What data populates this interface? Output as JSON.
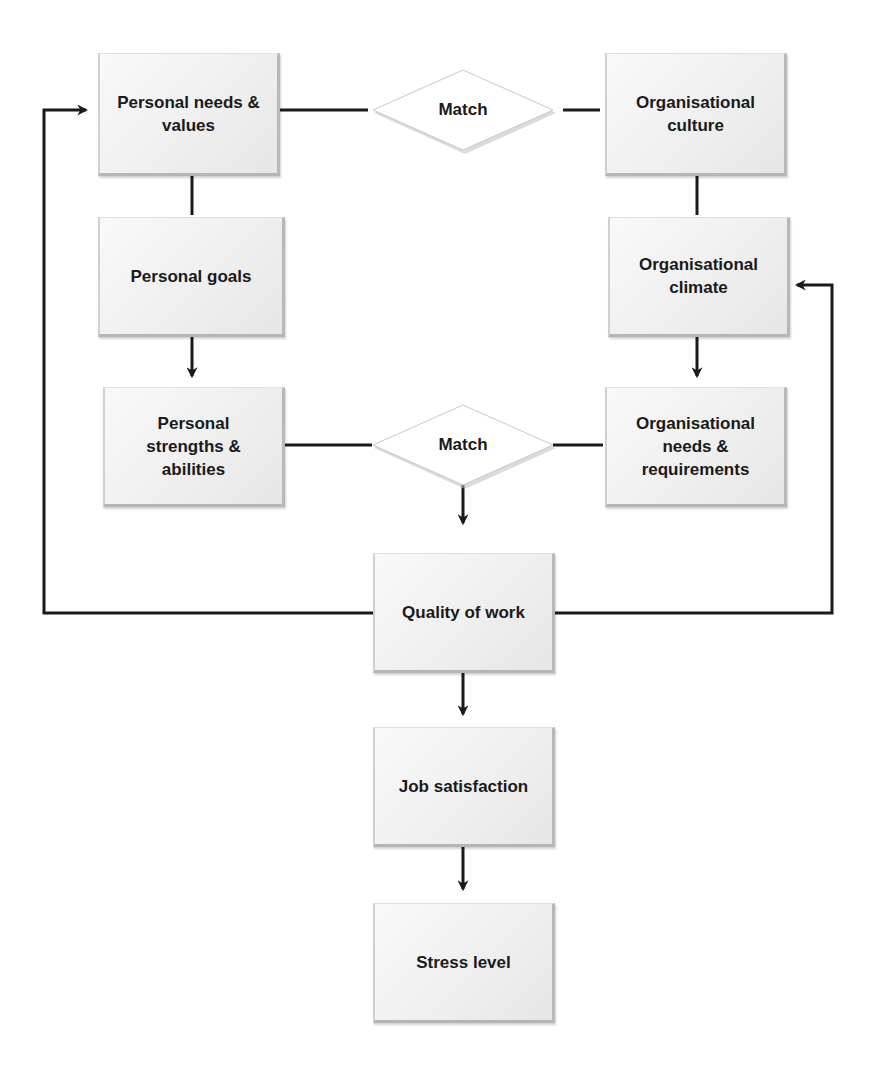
{
  "diagram": {
    "type": "flowchart",
    "nodes": {
      "personal_needs": {
        "label": "Personal needs & values",
        "lines": [
          "Personal needs",
          "& values"
        ]
      },
      "personal_goals": {
        "label": "Personal goals"
      },
      "personal_strengths": {
        "label": "Personal strengths & abilities"
      },
      "match_top": {
        "label": "Match"
      },
      "match_bottom": {
        "label": "Match"
      },
      "org_culture": {
        "label": "Organisational culture"
      },
      "org_climate": {
        "label": "Organisational climate"
      },
      "org_needs": {
        "label": "Organisational needs & requirements"
      },
      "quality_of_work": {
        "label": "Quality of work"
      },
      "job_satisfaction": {
        "label": "Job satisfaction"
      },
      "stress_level": {
        "label": "Stress level"
      }
    },
    "edges": [
      {
        "from": "personal_needs",
        "to": "match_top",
        "arrow": false
      },
      {
        "from": "match_top",
        "to": "org_culture",
        "arrow": false
      },
      {
        "from": "personal_needs",
        "to": "personal_goals",
        "arrow": false
      },
      {
        "from": "personal_goals",
        "to": "personal_strengths",
        "arrow": true
      },
      {
        "from": "org_culture",
        "to": "org_climate",
        "arrow": false
      },
      {
        "from": "org_climate",
        "to": "org_needs",
        "arrow": true
      },
      {
        "from": "personal_strengths",
        "to": "match_bottom",
        "arrow": false
      },
      {
        "from": "match_bottom",
        "to": "org_needs",
        "arrow": false
      },
      {
        "from": "match_bottom",
        "to": "quality_of_work",
        "arrow": true
      },
      {
        "from": "quality_of_work",
        "to": "personal_needs",
        "arrow": true,
        "route": "feedback-left"
      },
      {
        "from": "quality_of_work",
        "to": "org_climate",
        "arrow": true,
        "route": "feedback-right"
      },
      {
        "from": "quality_of_work",
        "to": "job_satisfaction",
        "arrow": true
      },
      {
        "from": "job_satisfaction",
        "to": "stress_level",
        "arrow": true
      }
    ],
    "colors": {
      "line": "#1a1a1a",
      "box_fill": "#efefef",
      "box_shadow": "#b5b5b5",
      "text": "#1a1a1a",
      "background": "#ffffff"
    }
  }
}
